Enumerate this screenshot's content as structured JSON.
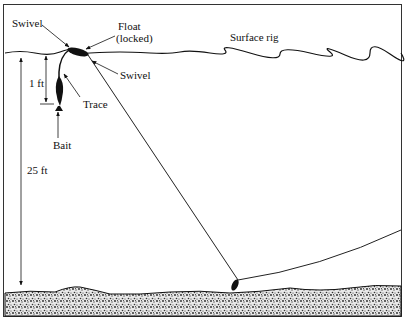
{
  "diagram": {
    "title": "Surface rig",
    "labels": {
      "swivel_top": "Swivel",
      "float_line1": "Float",
      "float_line2": "(locked)",
      "swivel_right": "Swivel",
      "depth_short": "1 ft",
      "trace": "Trace",
      "bait": "Bait",
      "depth_total": "25 ft"
    },
    "colors": {
      "ink": "#111111",
      "background": "#ffffff"
    }
  }
}
